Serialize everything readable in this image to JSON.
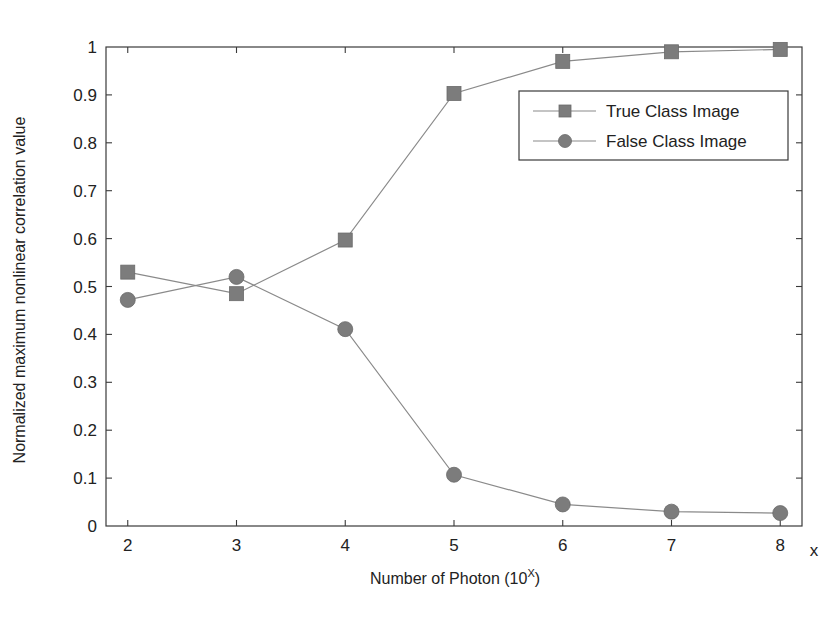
{
  "chart_data": {
    "type": "line",
    "title": "",
    "xlabel": "Number of Photon (10^X)",
    "xlabel_main": "Number of Photon (10",
    "xlabel_sup": "X",
    "xlabel_close": ")",
    "x_axis_suffix": "x",
    "ylabel": "Normalized maximum nonlinear correlation value",
    "x": [
      2,
      3,
      4,
      5,
      6,
      7,
      8
    ],
    "xlim": [
      1.8,
      8.2
    ],
    "ylim": [
      0,
      1
    ],
    "x_ticks": [
      "2",
      "3",
      "4",
      "5",
      "6",
      "7",
      "8"
    ],
    "y_ticks": [
      "0",
      "0.1",
      "0.2",
      "0.3",
      "0.4",
      "0.5",
      "0.6",
      "0.7",
      "0.8",
      "0.9",
      "1"
    ],
    "grid": false,
    "legend_position": "upper right",
    "series": [
      {
        "name": "True Class Image",
        "marker": "square",
        "color": "#7c7c7c",
        "values": [
          0.53,
          0.485,
          0.597,
          0.903,
          0.97,
          0.99,
          0.995
        ]
      },
      {
        "name": "False Class Image",
        "marker": "circle",
        "color": "#7c7c7c",
        "values": [
          0.472,
          0.52,
          0.411,
          0.107,
          0.045,
          0.03,
          0.027
        ]
      }
    ]
  }
}
